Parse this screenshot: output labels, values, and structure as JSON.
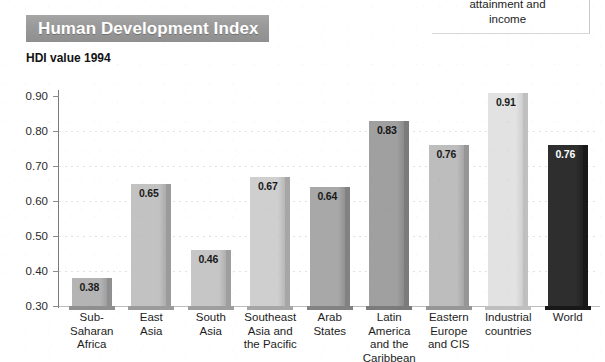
{
  "fragment": {
    "line1": "attainment and",
    "line2": "income"
  },
  "header": {
    "title": "Human Development Index",
    "subtitle": "HDI value 1994",
    "band_color": "#9a9a9a",
    "title_color": "#ffffff"
  },
  "chart_data": {
    "type": "bar",
    "title": "Human Development Index",
    "subtitle": "HDI value 1994",
    "xlabel": "",
    "ylabel": "HDI value 1994",
    "ylim": [
      0.3,
      0.9
    ],
    "ytick_labels": [
      "0.90",
      "0.80",
      "0.70",
      "0.60",
      "0.50",
      "0.40",
      "0.30"
    ],
    "yticks": [
      0.9,
      0.8,
      0.7,
      0.6,
      0.5,
      0.4,
      0.3
    ],
    "grid": true,
    "legend": "none",
    "categories": [
      "Sub-Saharan Africa",
      "East Asia",
      "South Asia",
      "Southeast Asia and the Pacific",
      "Arab States",
      "Latin America and the Caribbean",
      "Eastern Europe and CIS",
      "Industrial countries",
      "World"
    ],
    "values": [
      0.38,
      0.65,
      0.46,
      0.67,
      0.64,
      0.83,
      0.76,
      0.91,
      0.76
    ],
    "value_labels": [
      "0.38",
      "0.65",
      "0.46",
      "0.67",
      "0.64",
      "0.83",
      "0.76",
      "0.91",
      "0.76"
    ]
  },
  "bars": [
    {
      "name": "sub-saharan-africa",
      "value_label": "0.38",
      "label_lines": [
        "Sub-",
        "Saharan",
        "Africa"
      ],
      "fill": "#b4b4b4",
      "edge": "#8f8f8f",
      "label_color": "#1a1a1a"
    },
    {
      "name": "east-asia",
      "value_label": "0.65",
      "label_lines": [
        "East",
        "Asia"
      ],
      "fill": "#c2c2c2",
      "edge": "#9b9b9b",
      "label_color": "#1a1a1a"
    },
    {
      "name": "south-asia",
      "value_label": "0.46",
      "label_lines": [
        "South",
        "Asia"
      ],
      "fill": "#c6c6c6",
      "edge": "#9e9e9e",
      "label_color": "#1a1a1a"
    },
    {
      "name": "southeast-asia-and-the-pacific",
      "value_label": "0.67",
      "label_lines": [
        "Southeast",
        "Asia and",
        "the Pacific"
      ],
      "fill": "#cfcfcf",
      "edge": "#a6a6a6",
      "label_color": "#1a1a1a"
    },
    {
      "name": "arab-states",
      "value_label": "0.64",
      "label_lines": [
        "Arab",
        "States"
      ],
      "fill": "#a8a8a8",
      "edge": "#828282",
      "label_color": "#1a1a1a"
    },
    {
      "name": "latin-america-and-the-caribbean",
      "value_label": "0.83",
      "label_lines": [
        "Latin",
        "America",
        "and the",
        "Caribbean"
      ],
      "fill": "#a0a0a0",
      "edge": "#7b7b7b",
      "label_color": "#141414"
    },
    {
      "name": "eastern-europe-and-cis",
      "value_label": "0.76",
      "label_lines": [
        "Eastern",
        "Europe",
        "and CIS"
      ],
      "fill": "#bdbdbd",
      "edge": "#969696",
      "label_color": "#1a1a1a"
    },
    {
      "name": "industrial-countries",
      "value_label": "0.91",
      "label_lines": [
        "Industrial",
        "countries"
      ],
      "fill": "#e2e2e2",
      "edge": "#bfbfbf",
      "label_color": "#1a1a1a"
    },
    {
      "name": "world",
      "value_label": "0.76",
      "label_lines": [
        "World"
      ],
      "fill": "#2e2e2e",
      "edge": "#181818",
      "label_color": "#ffffff"
    }
  ]
}
